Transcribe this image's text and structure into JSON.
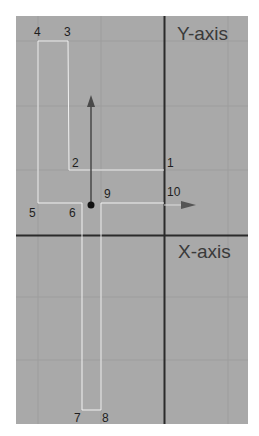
{
  "diagram": {
    "axis_labels": {
      "y": "Y-axis",
      "x": "X-axis"
    },
    "points": [
      {
        "id": "1",
        "label": "1"
      },
      {
        "id": "2",
        "label": "2"
      },
      {
        "id": "3",
        "label": "3"
      },
      {
        "id": "4",
        "label": "4"
      },
      {
        "id": "5",
        "label": "5"
      },
      {
        "id": "6",
        "label": "6"
      },
      {
        "id": "7",
        "label": "7"
      },
      {
        "id": "8",
        "label": "8"
      },
      {
        "id": "9",
        "label": "9"
      },
      {
        "id": "10",
        "label": "10"
      }
    ],
    "colors": {
      "background": "#a9a9a9",
      "axis_line": "#2b2b2b",
      "outline": "#f2f2f2",
      "grid": "#9a9a9a",
      "arrow": "#4a4a4a"
    }
  }
}
